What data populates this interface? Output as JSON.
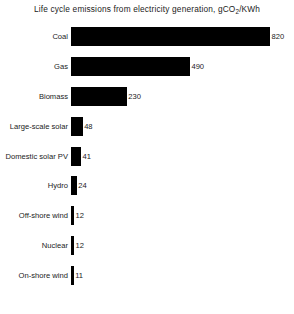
{
  "chart_data": {
    "type": "bar",
    "orientation": "horizontal",
    "title_prefix": "Life cycle emissions from electricity generation, gCO",
    "title_sub": "2",
    "title_suffix": "/KWh",
    "title": "Life cycle emissions from electricity generation, gCO2/KWh",
    "xlabel": "",
    "ylabel": "",
    "xlim": [
      0,
      820
    ],
    "grid": false,
    "legend": "none",
    "bar_color": "#000000",
    "categories": [
      "Coal",
      "Gas",
      "Biomass",
      "Large-scale solar",
      "Domestic solar PV",
      "Hydro",
      "Off-shore wind",
      "Nuclear",
      "On-shore wind"
    ],
    "values": [
      820,
      490,
      230,
      48,
      41,
      24,
      12,
      12,
      11
    ],
    "value_labels": [
      "820",
      "490",
      "230",
      "48",
      "41",
      "24",
      "12",
      "12",
      "11"
    ],
    "bars": [
      {
        "label": "Coal",
        "value": 820,
        "value_label": "820"
      },
      {
        "label": "Gas",
        "value": 490,
        "value_label": "490"
      },
      {
        "label": "Biomass",
        "value": 230,
        "value_label": "230"
      },
      {
        "label": "Large-scale solar",
        "value": 48,
        "value_label": "48"
      },
      {
        "label": "Domestic solar PV",
        "value": 41,
        "value_label": "41"
      },
      {
        "label": "Hydro",
        "value": 24,
        "value_label": "24"
      },
      {
        "label": "Off-shore wind",
        "value": 12,
        "value_label": "12"
      },
      {
        "label": "Nuclear",
        "value": 12,
        "value_label": "12"
      },
      {
        "label": "On-shore wind",
        "value": 11,
        "value_label": "11"
      }
    ]
  },
  "footnote": ""
}
